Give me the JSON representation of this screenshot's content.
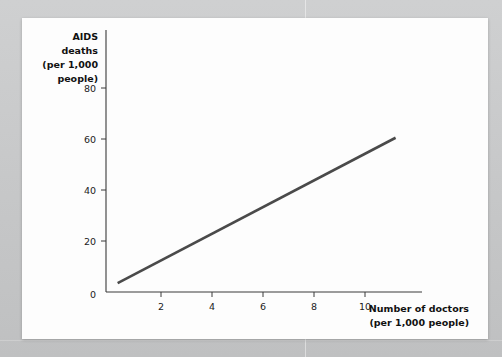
{
  "figure": {
    "background_color": "#fdfdfd",
    "surround_color": "#c9cacb",
    "line_color": "#4a4a4a",
    "axis_color": "#3a3a3a"
  },
  "chart_data": {
    "type": "line",
    "title": "",
    "subtitle": "",
    "xlabel": "Number of doctors (per 1,000 people)",
    "xlabel_lines": [
      "Number of doctors",
      "(per 1,000 people)"
    ],
    "ylabel": "AIDS deaths (per 1,000 people)",
    "ylabel_lines": [
      "AIDS",
      "deaths",
      "(per 1,000",
      "people)"
    ],
    "xlim": [
      0,
      11.8
    ],
    "ylim": [
      0,
      88
    ],
    "xticks": [
      2,
      4,
      6,
      8,
      10
    ],
    "xtick_labels": [
      "2",
      "4",
      "6",
      "8",
      "10"
    ],
    "yticks": [
      0,
      20,
      40,
      60,
      80
    ],
    "ytick_labels": [
      "0",
      "20",
      "40",
      "60",
      "80"
    ],
    "grid": false,
    "legend": null,
    "origin_label": "0",
    "series": [
      {
        "name": "AIDS deaths vs doctors",
        "color": "#4a4a4a",
        "x": [
          0.3,
          11.2
        ],
        "y": [
          3.5,
          60.5
        ],
        "style": "solid",
        "width": 2.6
      }
    ],
    "annotations": []
  }
}
